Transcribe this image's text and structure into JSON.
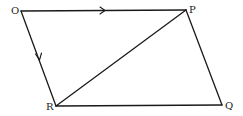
{
  "diagram": {
    "type": "parallelogram",
    "vertices": [
      {
        "id": "O",
        "label": "O",
        "x": 21,
        "y": 11,
        "label_x": 11,
        "label_y": 14
      },
      {
        "id": "P",
        "label": "P",
        "x": 186,
        "y": 10,
        "label_x": 189,
        "label_y": 13
      },
      {
        "id": "Q",
        "label": "Q",
        "x": 222,
        "y": 105,
        "label_x": 225,
        "label_y": 108
      },
      {
        "id": "R",
        "label": "R",
        "x": 56,
        "y": 106,
        "label_x": 46,
        "label_y": 109
      }
    ],
    "edges": [
      {
        "from": "O",
        "to": "P",
        "arrow": true
      },
      {
        "from": "P",
        "to": "Q",
        "arrow": false
      },
      {
        "from": "Q",
        "to": "R",
        "arrow": false
      },
      {
        "from": "R",
        "to": "O",
        "arrow": false
      },
      {
        "from": "O",
        "to": "R",
        "arrow": true
      },
      {
        "from": "R",
        "to": "P",
        "arrow": false,
        "diagonal": true
      }
    ],
    "line_color": "#1a1a1a"
  }
}
